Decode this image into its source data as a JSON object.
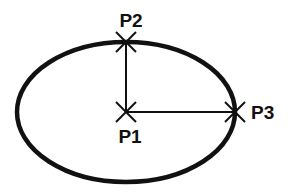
{
  "diagram": {
    "type": "ellipse-construction",
    "colors": {
      "stroke": "#111111",
      "background": "#ffffff"
    },
    "ellipse": {
      "cx": 126,
      "cy": 112,
      "rx": 109,
      "ry": 70
    },
    "points": [
      {
        "id": "p1",
        "label": "P1",
        "x": 126,
        "y": 112,
        "role": "center"
      },
      {
        "id": "p2",
        "label": "P2",
        "x": 126,
        "y": 42,
        "role": "minor-axis endpoint"
      },
      {
        "id": "p3",
        "label": "P3",
        "x": 235,
        "y": 112,
        "role": "major-axis endpoint"
      }
    ],
    "segments": [
      {
        "from": "P1",
        "to": "P2"
      },
      {
        "from": "P1",
        "to": "P3"
      }
    ]
  }
}
